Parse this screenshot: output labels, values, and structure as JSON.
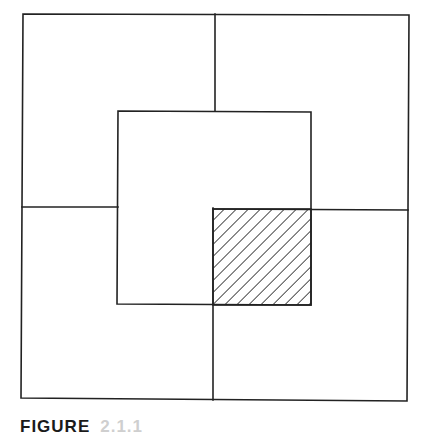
{
  "figure": {
    "caption_label": "FIGURE",
    "caption_number": "2.1.1",
    "stroke_color": "#222222",
    "background": "#ffffff",
    "outer_square": {
      "x1": 23,
      "y1": 14,
      "x2": 408,
      "y2": 400
    },
    "inner_square": {
      "x1": 118,
      "y1": 111,
      "x2": 311,
      "y2": 305
    },
    "dividers": {
      "top_vertical": {
        "x": 215,
        "y_from": 14,
        "y_to": 111
      },
      "bottom_vertical": {
        "x": 213,
        "y_from": 208,
        "y_to": 400
      },
      "left_horizontal": {
        "y": 207,
        "x_from": 23,
        "x_to": 118
      },
      "right_horizontal": {
        "y": 209,
        "x_from": 213,
        "x_to": 408
      }
    },
    "hatched_region": {
      "x1": 213,
      "y1": 209,
      "x2": 311,
      "y2": 305,
      "pattern": "diagonal-lines",
      "spacing_px": 8.5
    }
  }
}
